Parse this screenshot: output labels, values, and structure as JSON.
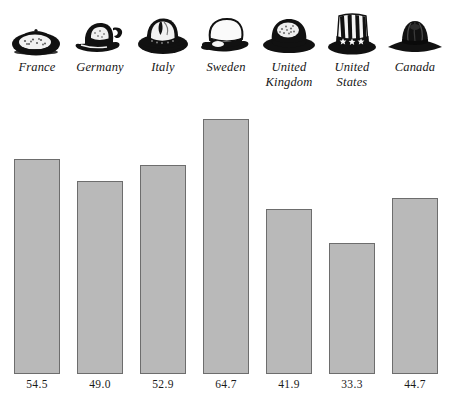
{
  "chart_data": {
    "type": "bar",
    "title": "",
    "xlabel": "",
    "ylabel": "",
    "categories": [
      "France",
      "Germany",
      "Italy",
      "Sweden",
      "United Kingdom",
      "United States",
      "Canada"
    ],
    "values": [
      54.5,
      49.0,
      52.9,
      64.7,
      41.9,
      33.3,
      44.7
    ],
    "value_labels": [
      "54.5",
      "49.0",
      "52.9",
      "64.7",
      "41.9",
      "33.3",
      "44.7"
    ],
    "ylim": [
      0,
      71
    ],
    "grid": false,
    "legend": "none",
    "bar_fill_color": "#b9b9b9",
    "bar_border_color": "#6d6d6d",
    "background_color": "#ffffff",
    "text_color": "#151515"
  },
  "categories": [
    {
      "label_line1": "France",
      "label_line2": "",
      "value_label": "54.5",
      "icon": "beret-hat-icon"
    },
    {
      "label_line1": "Germany",
      "label_line2": "",
      "value_label": "49.0",
      "icon": "tyrolean-hat-icon"
    },
    {
      "label_line1": "Italy",
      "label_line2": "",
      "value_label": "52.9",
      "icon": "fedora-hat-icon"
    },
    {
      "label_line1": "Sweden",
      "label_line2": "",
      "value_label": "64.7",
      "icon": "student-cap-icon"
    },
    {
      "label_line1": "United",
      "label_line2": "Kingdom",
      "value_label": "41.9",
      "icon": "bowler-hat-icon"
    },
    {
      "label_line1": "United",
      "label_line2": "States",
      "value_label": "33.3",
      "icon": "top-hat-stars-stripes-icon"
    },
    {
      "label_line1": "Canada",
      "label_line2": "",
      "value_label": "44.7",
      "icon": "mountie-hat-icon"
    }
  ]
}
